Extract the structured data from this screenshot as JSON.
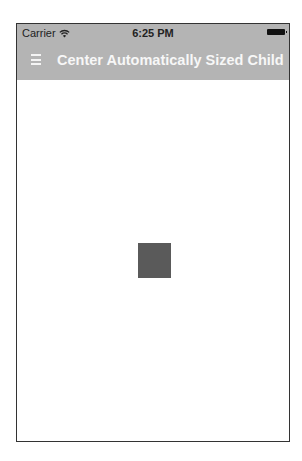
{
  "status_bar": {
    "carrier": "Carrier",
    "wifi_icon": "wifi-icon",
    "time": "6:25 PM",
    "battery_icon": "battery-icon"
  },
  "nav_bar": {
    "menu_icon": "hamburger-menu-icon",
    "title": "Center Automatically Sized Child",
    "background_color": "#b4b4b4",
    "title_color": "#f7f7f7"
  },
  "content": {
    "child_box_color": "#5a5a5a",
    "background_color": "#ffffff"
  }
}
